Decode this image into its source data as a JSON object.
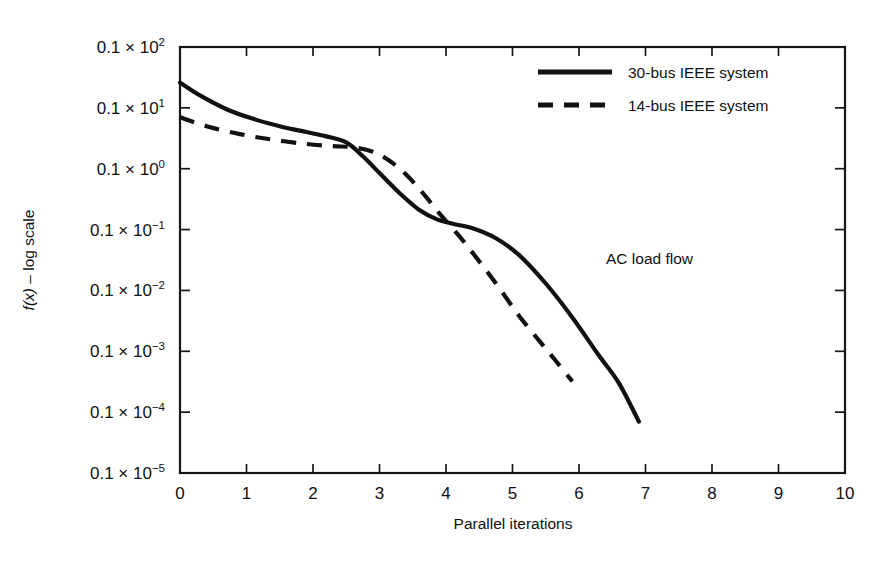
{
  "chart_data": {
    "type": "line",
    "title": "",
    "xlabel": "Parallel iterations",
    "ylabel": "f(x) – log scale",
    "ylabel_parts": {
      "fx": "f(x)",
      "rest": " – log scale"
    },
    "annotation": "AC load flow",
    "xlim": [
      0,
      10
    ],
    "ylim_log10": [
      -6,
      1
    ],
    "grid": false,
    "legend_position": "top-right",
    "xticks": [
      0,
      1,
      2,
      3,
      4,
      5,
      6,
      7,
      8,
      9,
      10
    ],
    "xticklabels": [
      "0",
      "1",
      "2",
      "3",
      "4",
      "5",
      "6",
      "7",
      "8",
      "9",
      "10"
    ],
    "yticks_mantissa": "0.1",
    "ytick_times": "×",
    "yticklabels": [
      {
        "mantissa": "0.1",
        "times": "×",
        "base": "10",
        "exp": "2",
        "value": 10
      },
      {
        "mantissa": "0.1",
        "times": "×",
        "base": "10",
        "exp": "1",
        "value": 1
      },
      {
        "mantissa": "0.1",
        "times": "×",
        "base": "10",
        "exp": "0",
        "value": 0.1
      },
      {
        "mantissa": "0.1",
        "times": "×",
        "base": "10",
        "exp": "−1",
        "value": 0.01
      },
      {
        "mantissa": "0.1",
        "times": "×",
        "base": "10",
        "exp": "−2",
        "value": 0.001
      },
      {
        "mantissa": "0.1",
        "times": "×",
        "base": "10",
        "exp": "−3",
        "value": 0.0001
      },
      {
        "mantissa": "0.1",
        "times": "×",
        "base": "10",
        "exp": "−4",
        "value": 1e-05
      },
      {
        "mantissa": "0.1",
        "times": "×",
        "base": "10",
        "exp": "−5",
        "value": 1e-06
      }
    ],
    "series": [
      {
        "name": "30-bus IEEE system",
        "style": "solid",
        "color": "#111111",
        "x": [
          0.0,
          0.3,
          0.7,
          1.1,
          1.5,
          1.9,
          2.2,
          2.5,
          2.75,
          3.0,
          3.3,
          3.6,
          3.85,
          4.1,
          4.4,
          4.75,
          5.1,
          5.5,
          5.9,
          6.3,
          6.6,
          6.9
        ],
        "y": [
          2.6,
          1.6,
          0.95,
          0.66,
          0.5,
          0.4,
          0.34,
          0.27,
          0.16,
          0.085,
          0.04,
          0.021,
          0.015,
          0.0125,
          0.0105,
          0.0072,
          0.0038,
          0.0013,
          0.00036,
          8.5e-05,
          3e-05,
          7e-06
        ]
      },
      {
        "name": "14-bus IEEE system",
        "style": "dashed",
        "color": "#111111",
        "x": [
          0.0,
          0.4,
          0.9,
          1.4,
          1.9,
          2.3,
          2.6,
          2.9,
          3.15,
          3.4,
          3.65,
          3.9,
          4.2,
          4.5,
          4.8,
          5.1,
          5.4,
          5.65,
          5.9
        ],
        "y": [
          0.7,
          0.5,
          0.37,
          0.3,
          0.255,
          0.235,
          0.225,
          0.19,
          0.135,
          0.08,
          0.04,
          0.0185,
          0.0078,
          0.003,
          0.0011,
          0.00038,
          0.00015,
          7e-05,
          3.2e-05
        ]
      }
    ]
  },
  "legend": {
    "items": [
      {
        "label": "30-bus IEEE system",
        "style": "solid"
      },
      {
        "label": "14-bus IEEE system",
        "style": "dashed"
      }
    ]
  }
}
